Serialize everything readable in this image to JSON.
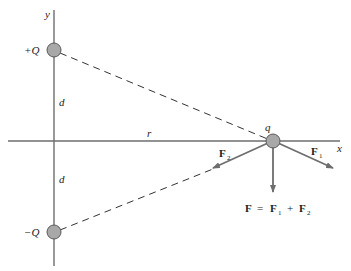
{
  "diagram": {
    "type": "electric-field-dipole-force",
    "axes": {
      "x_label": "x",
      "y_label": "y"
    },
    "charges": [
      {
        "id": "positive",
        "label": "+Q"
      },
      {
        "id": "negative",
        "label": "−Q"
      },
      {
        "id": "test",
        "label": "q"
      }
    ],
    "distances": {
      "upper_d": "d",
      "lower_d": "d",
      "r": "r"
    },
    "forces": {
      "F1": {
        "main": "F",
        "sub": "1"
      },
      "F2": {
        "main": "F",
        "sub": "2"
      }
    },
    "equation": {
      "lhs": "F",
      "eq": "=",
      "t1": "F",
      "t1_sub": "1",
      "plus": "+",
      "t2": "F",
      "t2_sub": "2"
    },
    "colors": {
      "axis": "#6e6e6e",
      "charge_fill": "#a8a8a8",
      "charge_stroke": "#5a5a5a",
      "arrow": "#6e6e6e",
      "dashed": "#333333",
      "text": "#222222"
    }
  }
}
